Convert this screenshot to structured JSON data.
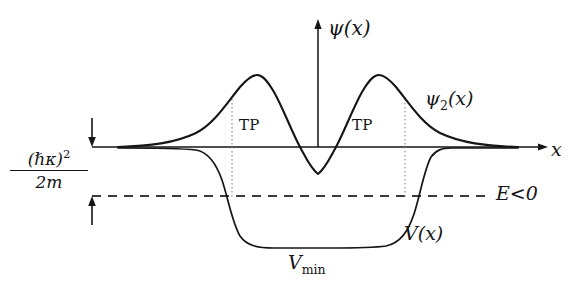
{
  "figure": {
    "background_color": "#ffffff",
    "ink_color": "#151515",
    "width": 581,
    "height": 298
  },
  "axes": {
    "y_axis_label": "ψ(x)",
    "x_axis_label": "x",
    "x_axis_y_px": 147,
    "y_axis_x_px": 318,
    "x_axis_start_px": 92,
    "x_axis_end_px": 548,
    "y_axis_top_px": 20,
    "y_axis_bottom_px": 147
  },
  "labels": {
    "psi_axis": "ψ(x)",
    "psi_curve": "ψ",
    "psi_curve_sub": "2",
    "psi_curve_tail": "(x)",
    "x_axis": "x",
    "energy_level": "E<0",
    "potential_curve": "V(x)",
    "potential_min": "V",
    "potential_min_sub": "min",
    "turning_point_left": "TP",
    "turning_point_right": "TP",
    "energy_gap_numerator": "(ℏκ)",
    "energy_gap_numerator_sup": "2",
    "energy_gap_denominator": "2m"
  },
  "chart_data": {
    "type": "line",
    "xlabel": "x",
    "ylabel": "ψ(x)",
    "grid": false,
    "legend": "inline-annotations",
    "baseline_y": 147,
    "energy_line_y": 196,
    "potential_floor_y": 248,
    "annotations": [
      {
        "text": "TP",
        "x": 239,
        "y": 118,
        "meaning": "left turning point marker"
      },
      {
        "text": "TP",
        "x": 352,
        "y": 118,
        "meaning": "right turning point marker"
      },
      {
        "text": "E<0",
        "x": 496,
        "y": 184,
        "meaning": "negative bound-state energy level"
      },
      {
        "text": "V(x)",
        "x": 404,
        "y": 224,
        "meaning": "potential energy curve label"
      },
      {
        "text": "Vmin",
        "x": 288,
        "y": 253,
        "meaning": "minimum of the potential well"
      },
      {
        "text": "(hbar kappa)^2 / 2m",
        "x": 10,
        "y": 149,
        "meaning": "binding energy gap between zero level and E"
      },
      {
        "text": "psi_2(x)",
        "x": 425,
        "y": 89,
        "meaning": "second excited / antisymmetric wavefunction label"
      }
    ],
    "dotted_turning_point_lines_x": [
      232,
      405
    ],
    "series": [
      {
        "name": "ψ₂(x)",
        "description": "Antisymmetric bound-state wavefunction: two positive lobes with a negative central dip; decays exponentially outside the well.",
        "path": "M 118 147 C 150 146 175 143 196 133 C 214 124 227 103 240 87 C 247 79 252 75 257 75 C 263 75 268 82 274 92 C 283 108 291 130 300 147 C 306 158 311 169 318 174 C 325 169 330 158 336 147 C 345 130 353 108 362 92 C 368 82 373 75 379 75 C 384 75 389 79 396 87 C 409 103 422 124 440 133 C 461 143 486 146 518 147"
      },
      {
        "name": "V(x)",
        "description": "Finite square-like potential well with rounded corners; flat at zero outside, drops to Vmin inside.",
        "path": "M 118 148 C 150 148 178 148 196 150 C 208 152 216 163 222 180 C 228 198 232 222 240 236 C 247 246 258 248 274 248 C 290 248 310 248 330 248 C 352 248 372 248 386 246 C 400 243 408 232 414 214 C 420 196 424 170 431 157 C 436 150 442 148 452 148 C 480 148 505 148 518 148"
      }
    ]
  }
}
